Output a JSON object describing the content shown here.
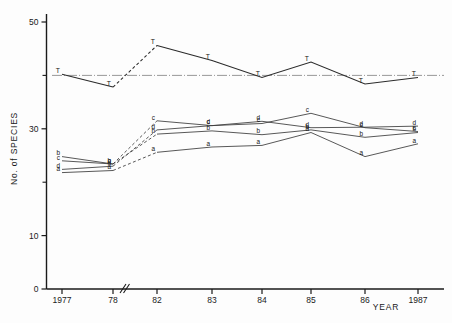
{
  "chart_data": {
    "type": "line",
    "title": "",
    "xlabel": "YEAR",
    "ylabel": "No. of SPECIES",
    "x_tick_labels": [
      "1977",
      "78",
      "82",
      "83",
      "84",
      "85",
      "86",
      "1987"
    ],
    "x_tick_values": [
      1977,
      1978,
      1982,
      1983,
      1984,
      1985,
      1986,
      1987
    ],
    "axis_break_after": "78",
    "y_tick_labels": [
      "0",
      "10",
      "30",
      "50"
    ],
    "y_tick_values": [
      0,
      10,
      30,
      50
    ],
    "y_minor_ticks": [
      20,
      40
    ],
    "ylim": [
      0,
      52
    ],
    "grid": false,
    "legend": "none",
    "point_markers": "letter-codes",
    "reference_line": {
      "label": "horizontal reference",
      "y": 40.0,
      "style": "dash-dot"
    },
    "series": [
      {
        "name": "T",
        "marker_label": "T",
        "style": "solid-with-dashed-gap",
        "dashed_segment_between": [
          "78",
          "82"
        ],
        "categories": [
          "1977",
          "78",
          "82",
          "83",
          "84",
          "85",
          "86",
          "1987"
        ],
        "values": [
          40.2,
          37.8,
          45.6,
          42.8,
          39.6,
          42.5,
          38.4,
          39.6
        ]
      },
      {
        "name": "a",
        "marker_label": "a",
        "style": "solid-with-dashed-gap",
        "dashed_segment_between": [
          "78",
          "82"
        ],
        "categories": [
          "1977",
          "78",
          "82",
          "83",
          "84",
          "85",
          "86",
          "1987"
        ],
        "values": [
          21.8,
          22.2,
          25.6,
          26.6,
          26.9,
          29.3,
          24.8,
          27.2
        ]
      },
      {
        "name": "b",
        "marker_label": "b",
        "style": "solid-with-dashed-gap",
        "dashed_segment_between": [
          "78",
          "82"
        ],
        "categories": [
          "1977",
          "78",
          "82",
          "83",
          "84",
          "85",
          "86",
          "1987"
        ],
        "values": [
          24.8,
          23.4,
          29.0,
          29.6,
          28.9,
          29.8,
          28.4,
          29.3
        ]
      },
      {
        "name": "c",
        "marker_label": "c",
        "style": "solid-with-dashed-gap",
        "dashed_segment_between": [
          "78",
          "82"
        ],
        "categories": [
          "1977",
          "78",
          "82",
          "83",
          "84",
          "85",
          "86",
          "1987"
        ],
        "values": [
          24.0,
          23.4,
          31.5,
          30.6,
          31.0,
          32.9,
          30.2,
          29.5
        ]
      },
      {
        "name": "d",
        "marker_label": "d",
        "style": "solid-with-dashed-gap",
        "dashed_segment_between": [
          "78",
          "82"
        ],
        "categories": [
          "1977",
          "78",
          "82",
          "83",
          "84",
          "85",
          "86",
          "1987"
        ],
        "values": [
          22.4,
          23.0,
          29.8,
          30.6,
          31.4,
          30.2,
          30.3,
          30.5
        ]
      }
    ],
    "series_point_label_offsets": {
      "T": "above-left",
      "a": "left",
      "b": "left",
      "c": "left",
      "d": "left"
    }
  }
}
